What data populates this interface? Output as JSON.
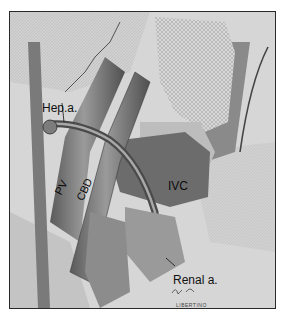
{
  "figure": {
    "type": "surgical-anatomy-illustration",
    "labels": {
      "hepatic_artery": "Hep.a.",
      "portal_vein": "PV",
      "common_bile_duct": "CBD",
      "inferior_vena_cava": "IVC",
      "renal_artery": "Renal a."
    },
    "signature": {
      "scribble": "ƒ~ p.",
      "name": "LIBERTINO"
    },
    "colors": {
      "frame": "#2a2a2a",
      "background": "#dcdcdc",
      "vessel_dark": "#6e6e6e",
      "vessel_mid": "#8a8a8a",
      "tissue_light": "#c8c8c8"
    }
  }
}
